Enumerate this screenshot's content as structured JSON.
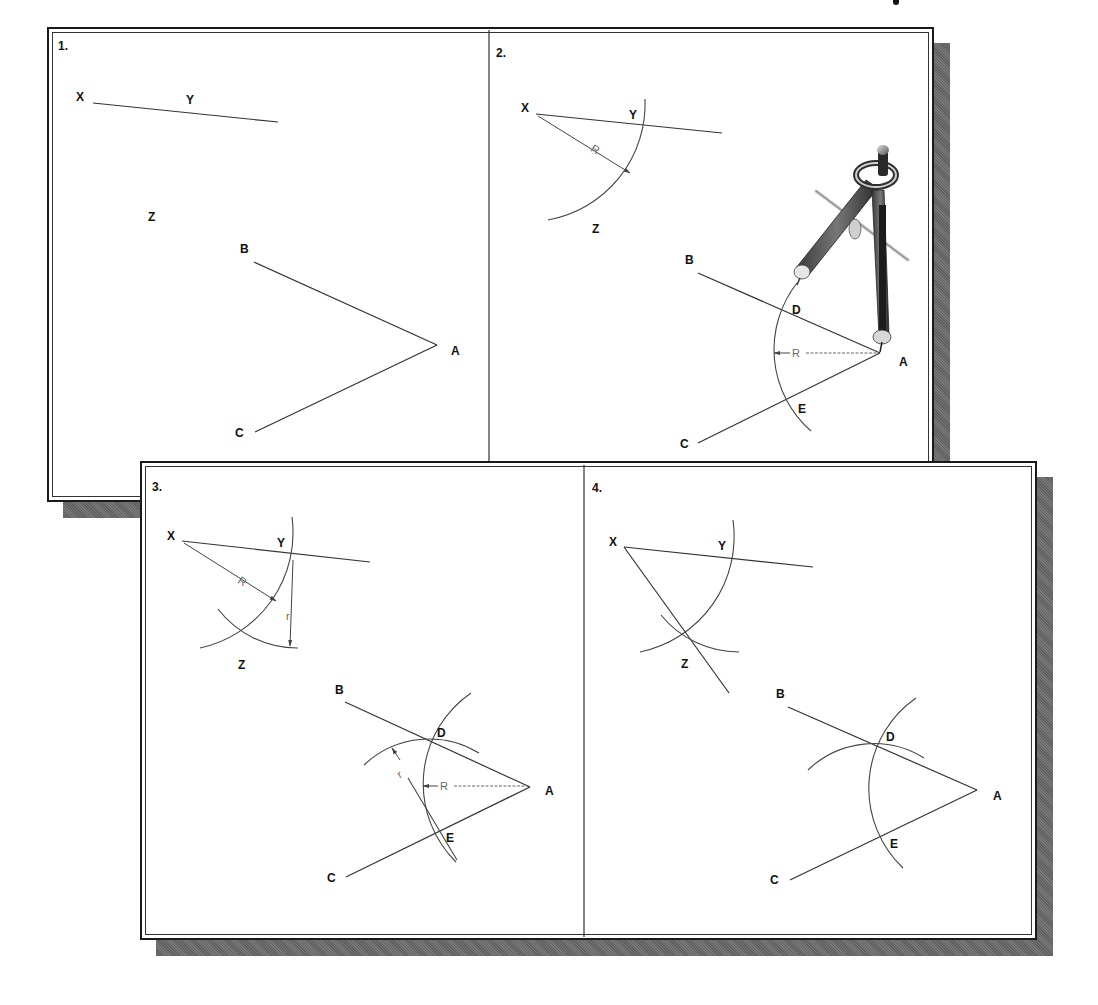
{
  "figure": {
    "colors": {
      "frame_border": "#1a1a1a",
      "shadow": "#6b6b6b",
      "line": "#333333",
      "dimension": "#666666",
      "background": "#ffffff"
    }
  },
  "panels": [
    {
      "step": "1.",
      "points": {
        "X": "X",
        "Y": "Y",
        "Z": "Z",
        "A": "A",
        "B": "B",
        "C": "C"
      },
      "dimensions": {}
    },
    {
      "step": "2.",
      "points": {
        "X": "X",
        "Y": "Y",
        "Z": "Z",
        "A": "A",
        "B": "B",
        "C": "C",
        "D": "D",
        "E": "E"
      },
      "dimensions": {
        "R1": "R",
        "R2": "R"
      },
      "tool": "compass"
    },
    {
      "step": "3.",
      "points": {
        "X": "X",
        "Y": "Y",
        "Z": "Z",
        "A": "A",
        "B": "B",
        "C": "C",
        "D": "D",
        "E": "E"
      },
      "dimensions": {
        "R1": "R",
        "r1": "r",
        "R2": "R",
        "r2": "r"
      }
    },
    {
      "step": "4.",
      "points": {
        "X": "X",
        "Y": "Y",
        "Z": "Z",
        "A": "A",
        "B": "B",
        "C": "C",
        "D": "D",
        "E": "E"
      },
      "dimensions": {}
    }
  ]
}
